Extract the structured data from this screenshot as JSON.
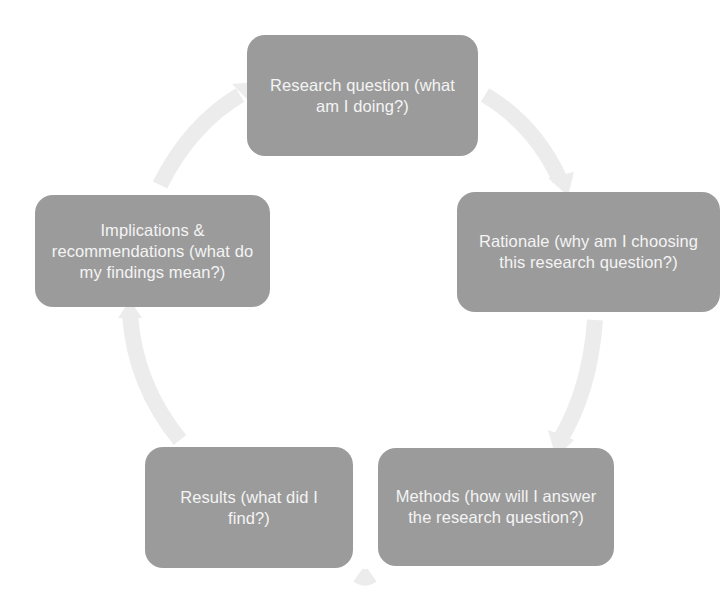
{
  "diagram": {
    "type": "cycle",
    "colors": {
      "node_fill": "#9b9b9b",
      "node_text": "#f4f4f4",
      "arrow": "#ececec",
      "background": "#ffffff"
    },
    "nodes": [
      {
        "id": "research",
        "label": "Research question (what am I doing?)"
      },
      {
        "id": "rationale",
        "label": "Rationale (why am I choosing this research question?)"
      },
      {
        "id": "methods",
        "label": "Methods (how will I answer the research question?)"
      },
      {
        "id": "results",
        "label": "Results (what did I find?)"
      },
      {
        "id": "implications",
        "label": "Implications & recommendations (what do my findings mean?)"
      }
    ],
    "edges": [
      {
        "from": "research",
        "to": "rationale"
      },
      {
        "from": "rationale",
        "to": "methods"
      },
      {
        "from": "methods",
        "to": "results"
      },
      {
        "from": "results",
        "to": "implications"
      },
      {
        "from": "implications",
        "to": "research"
      }
    ]
  }
}
